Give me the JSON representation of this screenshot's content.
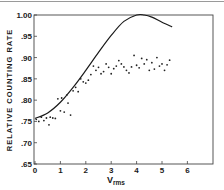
{
  "chart_data": {
    "type": "line",
    "title": "",
    "xlabel": "V",
    "xlabel_subscript": "rms",
    "ylabel": "RELATIVE COUNTING RATE",
    "xlim": [
      0,
      7
    ],
    "ylim": [
      0.65,
      1.0
    ],
    "x_ticks": [
      "0",
      "1",
      "2",
      "3",
      "4",
      "5",
      "6"
    ],
    "y_ticks": [
      ".65",
      ".70",
      ".75",
      ".80",
      ".85",
      ".90",
      ".95",
      "1.00"
    ],
    "grid": false,
    "legend": null,
    "series": [
      {
        "name": "theoretical curve",
        "style": "solid line",
        "x": [
          0,
          0.5,
          1.0,
          1.5,
          2.0,
          2.5,
          3.0,
          3.5,
          4.0,
          4.3,
          4.6,
          5.0,
          5.4
        ],
        "y": [
          0.757,
          0.77,
          0.795,
          0.83,
          0.87,
          0.912,
          0.952,
          0.985,
          1.0,
          1.0,
          0.995,
          0.983,
          0.972
        ]
      },
      {
        "name": "measured",
        "style": "dots",
        "x": [
          0.05,
          0.15,
          0.25,
          0.35,
          0.45,
          0.55,
          0.6,
          0.7,
          0.8,
          0.9,
          1.0,
          1.05,
          1.15,
          1.25,
          1.3,
          1.4,
          1.5,
          1.6,
          1.7,
          1.8,
          1.9,
          2.0,
          2.1,
          2.2,
          2.3,
          2.4,
          2.5,
          2.6,
          2.7,
          2.8,
          2.9,
          3.0,
          3.1,
          3.2,
          3.3,
          3.4,
          3.5,
          3.6,
          3.7,
          3.8,
          3.9,
          4.0,
          4.1,
          4.2,
          4.3,
          4.4,
          4.5,
          4.6,
          4.7,
          4.8,
          4.9,
          5.0,
          5.1,
          5.2,
          5.3
        ],
        "y": [
          0.755,
          0.75,
          0.76,
          0.752,
          0.758,
          0.742,
          0.76,
          0.758,
          0.757,
          0.803,
          0.775,
          0.805,
          0.772,
          0.812,
          0.793,
          0.765,
          0.822,
          0.83,
          0.82,
          0.85,
          0.843,
          0.84,
          0.847,
          0.86,
          0.88,
          0.87,
          0.877,
          0.862,
          0.867,
          0.885,
          0.877,
          0.862,
          0.874,
          0.88,
          0.893,
          0.885,
          0.878,
          0.87,
          0.864,
          0.878,
          0.905,
          0.882,
          0.876,
          0.898,
          0.885,
          0.895,
          0.87,
          0.888,
          0.873,
          0.9,
          0.88,
          0.885,
          0.87,
          0.883,
          0.894
        ]
      }
    ]
  }
}
